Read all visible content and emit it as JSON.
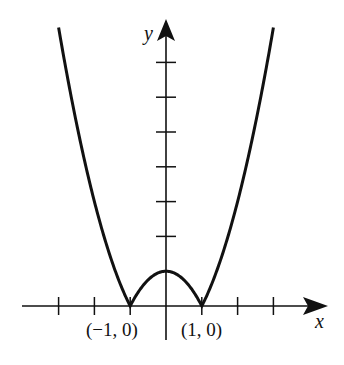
{
  "chart_data": {
    "type": "line",
    "title": "",
    "function": "y = |x^2 - 1|",
    "xlabel": "x",
    "ylabel": "y",
    "xlim": [
      -4,
      4.4
    ],
    "ylim": [
      -1,
      8.2
    ],
    "grid": false,
    "x_ticks": [
      -4,
      -3,
      -2,
      -1,
      1,
      2,
      3,
      4
    ],
    "y_ticks": [
      1,
      2,
      3,
      4,
      5,
      6,
      7
    ],
    "series": [
      {
        "name": "|x^2 - 1|",
        "x": [
          -3,
          -2.5,
          -2,
          -1.5,
          -1,
          -0.5,
          0,
          0.5,
          1,
          1.5,
          2,
          2.5,
          3
        ],
        "values": [
          8,
          5.25,
          3,
          1.25,
          0,
          0.75,
          1,
          0.75,
          0,
          1.25,
          3,
          5.25,
          8
        ]
      }
    ],
    "annotations": [
      {
        "text": "(−1, 0)",
        "x": -1,
        "y": 0
      },
      {
        "text": "(1, 0)",
        "x": 1,
        "y": 0
      }
    ]
  },
  "labels": {
    "x_axis": "x",
    "y_axis": "y",
    "point_left": "(−1, 0)",
    "point_right": "(1, 0)"
  },
  "colors": {
    "ink": "#111111",
    "background": "#ffffff"
  }
}
